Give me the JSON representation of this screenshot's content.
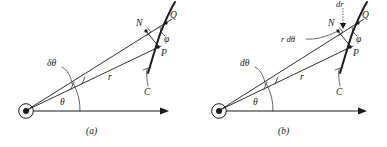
{
  "figure": {
    "kind": "polar-coordinate-geometry-diagram",
    "panel_count": 2,
    "stroke_color": "#1a1a1a",
    "background_color": "#ffffff"
  },
  "panel_a": {
    "caption": "(a)",
    "labels": {
      "delta_theta": "δθ",
      "r": "r",
      "theta": "θ",
      "N": "N",
      "Q": "Q",
      "P": "P",
      "phi": "φ",
      "C": "C"
    }
  },
  "panel_b": {
    "caption": "(b)",
    "labels": {
      "d_theta": "dθ",
      "r_d_theta": "r dθ",
      "dr": "dr",
      "r": "r",
      "theta": "θ",
      "N": "N",
      "Q": "Q",
      "P": "P",
      "phi": "φ",
      "C": "C"
    }
  }
}
